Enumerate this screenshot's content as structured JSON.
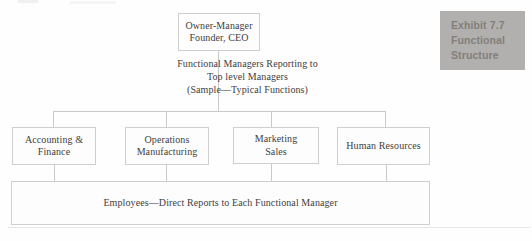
{
  "figure": {
    "top_box": {
      "lines": [
        "Owner-Manager",
        "Founder, CEO"
      ]
    },
    "middle_note": {
      "lines": [
        "Functional Managers Reporting to",
        "Top level Managers",
        "(Sample—Typical Functions)"
      ]
    },
    "function_boxes": [
      {
        "lines": [
          "Accounting &",
          "Finance"
        ]
      },
      {
        "lines": [
          "Operations",
          "Manufacturing"
        ]
      },
      {
        "lines": [
          "Marketing",
          "Sales"
        ]
      },
      {
        "lines": [
          "Human Resources"
        ]
      }
    ],
    "employees_box": {
      "label": "Employees—Direct Reports to Each Functional Manager"
    }
  },
  "exhibit_tag": {
    "lines": [
      "Exhibit 7.7",
      "Functional",
      "Structure"
    ],
    "bg_color": "#b2b0ae",
    "text_color": "#827f7a"
  },
  "colors": {
    "connector_line": "#c9c9c9",
    "box_border": "#cfcfcf",
    "text": "#3e3d3d",
    "background": "#fefefe"
  }
}
